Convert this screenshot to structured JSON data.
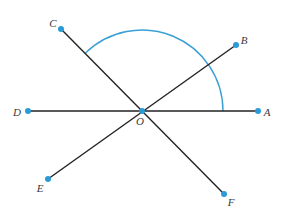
{
  "diagram": {
    "colors": {
      "line": "#222222",
      "point": "#2b9ad6",
      "arc": "#3a9fd4",
      "label": "#3a3a3a",
      "background": "#ffffff"
    },
    "center": {
      "name": "O",
      "label": "O",
      "x": 142,
      "y": 111,
      "label_x": 140,
      "label_y": 121
    },
    "points": [
      {
        "name": "A",
        "label": "A",
        "x": 258,
        "y": 111,
        "label_x": 267,
        "label_y": 112
      },
      {
        "name": "B",
        "label": "B",
        "x": 236,
        "y": 45,
        "label_x": 244,
        "label_y": 40
      },
      {
        "name": "C",
        "label": "C",
        "x": 61,
        "y": 29,
        "label_x": 53,
        "label_y": 23
      },
      {
        "name": "D",
        "label": "D",
        "x": 28,
        "y": 111,
        "label_x": 17,
        "label_y": 112
      },
      {
        "name": "E",
        "label": "E",
        "x": 48,
        "y": 179,
        "label_x": 40,
        "label_y": 188
      },
      {
        "name": "F",
        "label": "F",
        "x": 224,
        "y": 194,
        "label_x": 231,
        "label_y": 202
      }
    ],
    "segments": [
      {
        "from": "D",
        "to": "A",
        "description": "line DA through O"
      },
      {
        "from": "C",
        "to": "F",
        "description": "line CF through O"
      },
      {
        "from": "E",
        "to": "B",
        "description": "line EB through O"
      }
    ],
    "arc": {
      "center": "O",
      "radius": 81,
      "from_ray": "OA",
      "to_ray": "OC",
      "description": "angle AOC marked with arc",
      "start": {
        "x": 223,
        "y": 111
      },
      "end": {
        "x": 86,
        "y": 53
      }
    }
  }
}
